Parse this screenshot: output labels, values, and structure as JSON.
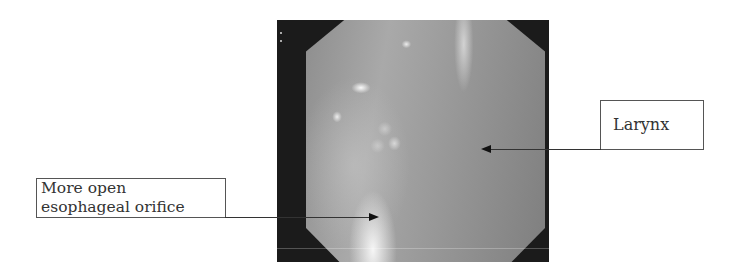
{
  "figure": {
    "image": {
      "description": "Endoscopic view with octagonal field of view",
      "frame_color": "#1b1b1b"
    },
    "annotations": [
      {
        "id": "esophageal-orifice",
        "label_lines": [
          "More open",
          "esophageal orifice"
        ],
        "arrow_direction": "right"
      },
      {
        "id": "larynx",
        "label_lines": [
          "Larynx"
        ],
        "arrow_direction": "left"
      }
    ]
  }
}
